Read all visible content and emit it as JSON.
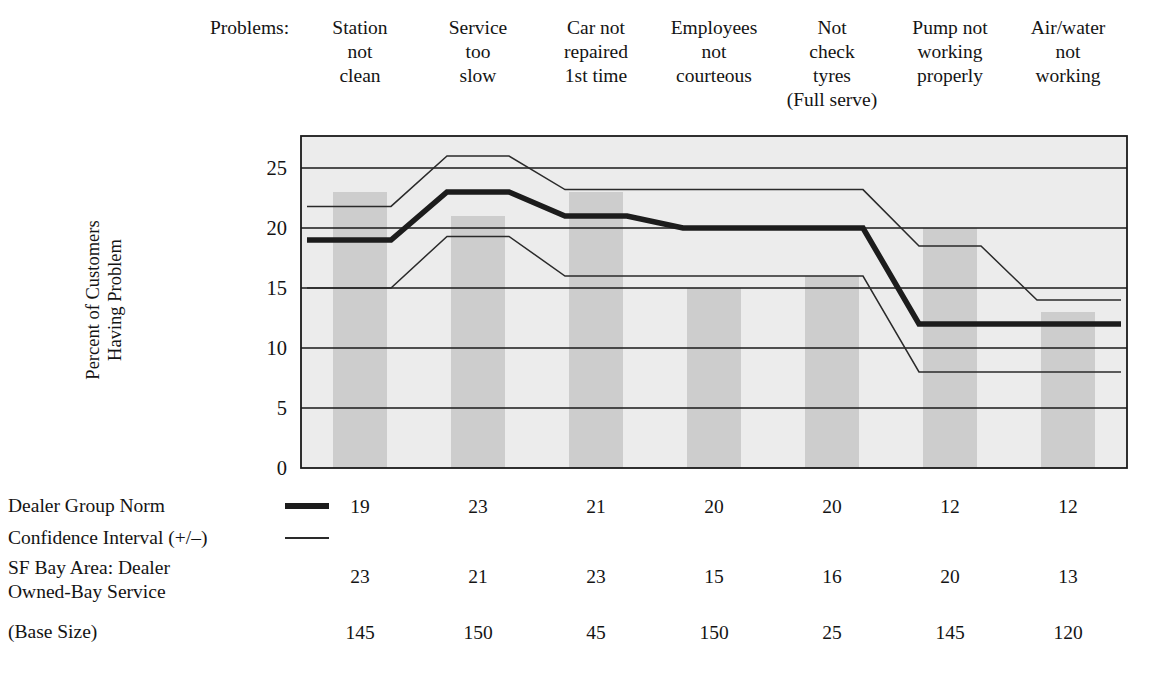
{
  "header": {
    "problems_label": "Problems:",
    "columns": [
      {
        "lines": [
          "Station",
          "not",
          "clean"
        ]
      },
      {
        "lines": [
          "Service",
          "too",
          "slow"
        ]
      },
      {
        "lines": [
          "Car not",
          "repaired",
          "1st time"
        ]
      },
      {
        "lines": [
          "Employees",
          "not",
          "courteous"
        ]
      },
      {
        "lines": [
          "Not",
          "check",
          "tyres",
          "(Full serve)"
        ]
      },
      {
        "lines": [
          "Pump not",
          "working",
          "properly"
        ]
      },
      {
        "lines": [
          "Air/water",
          "not",
          "working"
        ]
      }
    ]
  },
  "axis": {
    "y_title_lines": [
      "Percent of Customers",
      "Having Problem"
    ],
    "y_ticks": [
      "0",
      "5",
      "10",
      "15",
      "20",
      "25"
    ]
  },
  "table": {
    "rows": [
      {
        "label_lines": [
          "Dealer Group Norm"
        ],
        "swatch": "thick-line",
        "values": [
          "19",
          "23",
          "21",
          "20",
          "20",
          "12",
          "12"
        ]
      },
      {
        "label_lines": [
          "Confidence Interval (+/–)"
        ],
        "swatch": "thin-line",
        "values": []
      },
      {
        "label_lines": [
          "SF Bay Area: Dealer",
          "Owned-Bay Service"
        ],
        "swatch": "none",
        "values": [
          "23",
          "21",
          "23",
          "15",
          "16",
          "20",
          "13"
        ]
      },
      {
        "label_lines": [
          "(Base Size)"
        ],
        "swatch": "none",
        "values": [
          "145",
          "150",
          "45",
          "150",
          "25",
          "145",
          "120"
        ]
      }
    ]
  },
  "colors": {
    "plot_background": "#ececec",
    "bar_fill": "#cdcdcd",
    "gridline": "#1a1a1a",
    "norm_line": "#1c1c1c",
    "ci_line": "#2a2a2a",
    "text": "#141414",
    "page_background": "#ffffff"
  },
  "chart_data": {
    "type": "bar",
    "title": "",
    "xlabel": "",
    "ylabel": "Percent of Customers Having Problem",
    "ylim": [
      0,
      26.5
    ],
    "yticks": [
      0,
      5,
      10,
      15,
      20,
      25
    ],
    "grid": true,
    "legend": [
      "Dealer Group Norm",
      "Confidence Interval (+/–)"
    ],
    "legend_position": "below-axes-table",
    "categories": [
      "Station not clean",
      "Service too slow",
      "Car not repaired 1st time",
      "Employees not courteous",
      "Not check tyres (Full serve)",
      "Pump not working properly",
      "Air/water not working"
    ],
    "series": [
      {
        "name": "SF Bay Area: Dealer Owned-Bay Service",
        "render": "bar",
        "values": [
          23,
          21,
          23,
          15,
          16,
          20,
          13
        ]
      },
      {
        "name": "Dealer Group Norm",
        "render": "step-line-thick",
        "values": [
          19,
          23,
          21,
          20,
          20,
          12,
          12
        ]
      },
      {
        "name": "Confidence Interval upper",
        "render": "step-line-thin",
        "values": [
          21.8,
          26,
          23.2,
          23.2,
          23.2,
          18.5,
          14
        ]
      },
      {
        "name": "Confidence Interval lower",
        "render": "step-line-thin",
        "values": [
          15,
          19.3,
          16,
          16,
          16,
          8,
          8
        ]
      }
    ],
    "base_sizes": [
      145,
      150,
      45,
      150,
      25,
      145,
      120
    ]
  }
}
